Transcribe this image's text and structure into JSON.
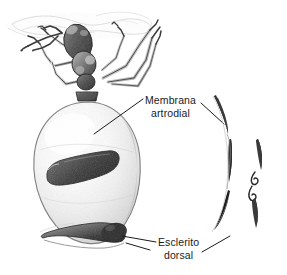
{
  "figure": {
    "kind": "scientific-illustration",
    "style": "pen-and-ink stipple drawing, grayscale",
    "background_color": "#ffffff",
    "ink_color": "#1b1b1b",
    "width": 287,
    "height": 275
  },
  "labels": {
    "membrana": {
      "line1": "Membrana",
      "line2": "artrodial",
      "full_text": "Membrana artrodial"
    },
    "esclerito": {
      "line1": "Esclerito",
      "line2": "dorsal",
      "full_text": "Esclerito dorsal"
    }
  },
  "parts": {
    "ceiling": "nest-ceiling-texture",
    "antennae": "ant-antennae",
    "head": "ant-head",
    "thorax": "ant-thorax",
    "legs": "ant-legs",
    "petiole": "ant-petiole",
    "gaster": "distended-gaster",
    "dorsal_sclerite_upper": "upper-dorsal-sclerite-plate",
    "dorsal_sclerite_lower": "lower-dorsal-sclerite-plate",
    "profile_curves": "sclerite-profile-cross-section",
    "detail_curves": "membrane-fold-detail"
  },
  "leaders": {
    "membrana_left": "leader-line-from-membrana-label-to-gaster",
    "membrana_right": "leader-line-from-membrana-label-to-profile",
    "esclerito_left": "leader-line-from-esclerito-label-to-sclerite",
    "esclerito_right": "leader-line-from-esclerito-label-to-profile"
  }
}
